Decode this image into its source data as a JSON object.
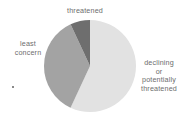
{
  "chart_data": {
    "type": "pie",
    "title": "",
    "subtitle": "",
    "xlabel": "",
    "ylabel": "",
    "grid": false,
    "legend_position": "none",
    "labels_position": "outside-callout",
    "center": {
      "x": 90,
      "y": 66
    },
    "radius": 46,
    "start_angle_deg": 0,
    "direction": "clockwise",
    "categories": [
      "declining or potentially threatened",
      "least concern",
      "threatened"
    ],
    "values": [
      57,
      30,
      13
    ],
    "units": "percent",
    "slices": [
      {
        "name": "declining-or-potentially-threatened",
        "label": "declining\nor\npotentially\nthreatened",
        "value": 57,
        "start_angle_deg": 0,
        "end_angle_deg": 205,
        "color": "#e2e2e2"
      },
      {
        "name": "least-concern",
        "label": "least\nconcern",
        "value": 30,
        "start_angle_deg": 205,
        "end_angle_deg": 335,
        "color": "#a3a3a3"
      },
      {
        "name": "threatened",
        "label": "threatened",
        "value": 13,
        "start_angle_deg": 335,
        "end_angle_deg": 360,
        "color": "#6e6e6e"
      }
    ]
  },
  "labels": {
    "threatened": "threatened",
    "least_concern": "least\nconcern",
    "declining": "declining\nor\npotentially\nthreatened"
  },
  "colors": {
    "background": "#ffffff",
    "text": "#6d6d6d",
    "slice_light": "#e2e2e2",
    "slice_medium": "#a3a3a3",
    "slice_dark": "#6e6e6e",
    "speck": "#8a8a8a"
  },
  "artifacts": {
    "speck_label": "scan-speck"
  }
}
